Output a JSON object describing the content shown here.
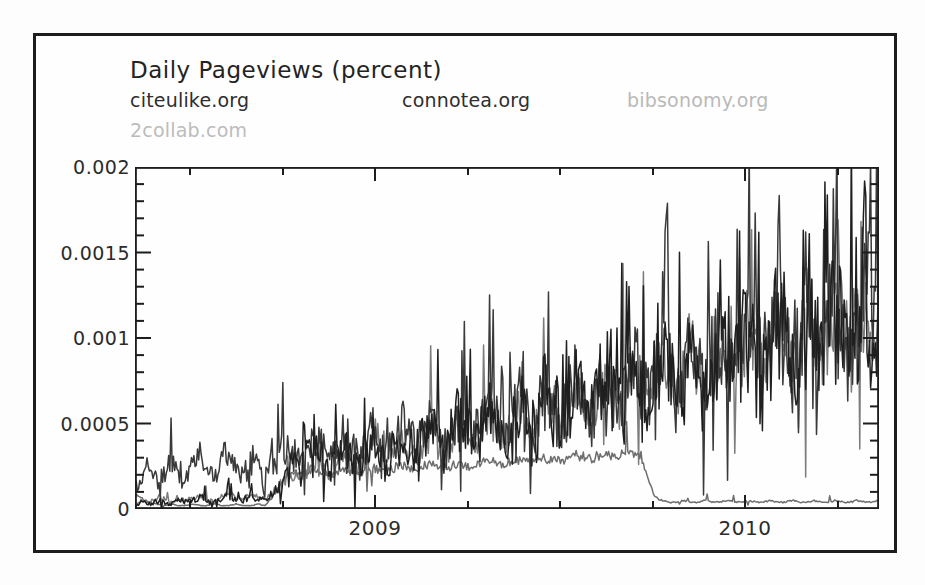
{
  "chart_data": {
    "type": "line",
    "title": "Daily Pageviews (percent)",
    "xlabel": "",
    "ylabel": "",
    "ylim": [
      0,
      0.002
    ],
    "yticks": [
      0,
      0.0005,
      0.001,
      0.0015,
      0.002
    ],
    "ytick_labels": [
      "0",
      "0.0005",
      "0.001",
      "0.0015",
      "0.002"
    ],
    "y_minor_ticks_per_interval": 4,
    "xlim": [
      "2008-09",
      "2010-06"
    ],
    "xticks": [
      "2009",
      "2010"
    ],
    "xtick_labels": [
      "2009",
      "2010"
    ],
    "x_minor_ticks_per_interval": 3,
    "grid": false,
    "legend_position": "top-left-inside",
    "series": [
      {
        "name": "citeulike.org",
        "color": "#3a3a3a",
        "values": [
          0.00012,
          0.00018,
          0.00024,
          0.00016,
          0.00021,
          0.00029,
          0.00022,
          0.00017,
          0.00026,
          0.00031,
          0.00024,
          0.00019,
          0.00028,
          0.00034,
          0.00026,
          0.00021,
          0.0003,
          0.00025,
          0.00019,
          0.00027,
          0.00033,
          0.00041,
          0.00032,
          0.00026,
          0.00035,
          0.00043,
          0.00036,
          0.00029,
          0.00038,
          0.00045,
          0.00037,
          0.0003,
          0.0004,
          0.00048,
          0.00039,
          0.00033,
          0.00042,
          0.0005,
          0.00041,
          0.00035,
          0.00044,
          0.00053,
          0.00044,
          0.00037,
          0.00047,
          0.00057,
          0.00048,
          0.0004,
          0.0005,
          0.0006,
          0.00051,
          0.00043,
          0.00054,
          0.00065,
          0.00055,
          0.00047,
          0.00058,
          0.0007,
          0.00059,
          0.0005,
          0.00062,
          0.00075,
          0.00064,
          0.00054,
          0.00067,
          0.00081,
          0.00069,
          0.00058,
          0.00072,
          0.00087,
          0.00074,
          0.00062,
          0.00078,
          0.00094,
          0.0008,
          0.00067,
          0.00083,
          0.001,
          0.00085,
          0.00071,
          0.00088,
          0.00106,
          0.0009,
          0.00076,
          0.00093,
          0.00112,
          0.00095,
          0.0008,
          0.00098,
          0.00118,
          0.001,
          0.00084,
          0.00103,
          0.00124,
          0.00105,
          0.00088,
          0.00108,
          0.0013,
          0.0011,
          0.00093,
          0.00113,
          0.00136,
          0.00115,
          0.00097
        ]
      },
      {
        "name": "connotea.org",
        "color": "#1f1f1f",
        "values": [
          2e-05,
          4e-05,
          3e-05,
          5e-05,
          4e-05,
          3e-05,
          6e-05,
          4e-05,
          5e-05,
          7e-05,
          5e-05,
          4e-05,
          6e-05,
          8e-05,
          6e-05,
          5e-05,
          8e-05,
          6e-05,
          5e-05,
          9e-05,
          0.00012,
          0.00018,
          0.00025,
          0.0002,
          0.00028,
          0.00034,
          0.00027,
          0.00022,
          0.00031,
          0.00038,
          0.0003,
          0.00025,
          0.00034,
          0.00042,
          0.00035,
          0.00029,
          0.00038,
          0.00046,
          0.00038,
          0.00032,
          0.00041,
          0.0005,
          0.00042,
          0.00035,
          0.00045,
          0.00054,
          0.00046,
          0.00039,
          0.00049,
          0.00059,
          0.0005,
          0.00042,
          0.00053,
          0.00064,
          0.00054,
          0.00046,
          0.00057,
          0.00069,
          0.00059,
          0.0005,
          0.00062,
          0.00075,
          0.00063,
          0.00053,
          0.00066,
          0.0008,
          0.00068,
          0.00057,
          0.00071,
          0.00086,
          0.00073,
          0.00061,
          0.00077,
          0.00092,
          0.00078,
          0.00066,
          0.00082,
          0.00098,
          0.00084,
          0.0007,
          0.00087,
          0.00104,
          0.00089,
          0.00075,
          0.00092,
          0.0011,
          0.00094,
          0.00079,
          0.00097,
          0.00116,
          0.00098,
          0.00083,
          0.00101,
          0.00121,
          0.00103,
          0.00087,
          0.00106,
          0.00127,
          0.00108,
          0.00091,
          0.00111,
          0.00133,
          0.00113,
          0.00095
        ]
      },
      {
        "name": "bibsonomy.org",
        "color": "#7c7c7c",
        "values": [
          3e-05,
          5e-05,
          4e-05,
          6e-05,
          5e-05,
          4e-05,
          7e-05,
          5e-05,
          6e-05,
          8e-05,
          6e-05,
          5e-05,
          7e-05,
          9e-05,
          7e-05,
          6e-05,
          9e-05,
          7e-05,
          6e-05,
          0.0001,
          0.00013,
          0.00017,
          0.00021,
          0.00018,
          0.00024,
          0.00029,
          0.00023,
          0.00019,
          0.00027,
          0.00033,
          0.00027,
          0.00022,
          0.00031,
          0.00038,
          0.00032,
          0.00026,
          0.00035,
          0.00043,
          0.00036,
          0.0003,
          0.00039,
          0.00047,
          0.0004,
          0.00034,
          0.00043,
          0.00052,
          0.00044,
          0.00037,
          0.00047,
          0.00057,
          0.00048,
          0.00041,
          0.00051,
          0.00062,
          0.00053,
          0.00045,
          0.00056,
          0.00067,
          0.00057,
          0.00048,
          0.0006,
          0.00073,
          0.00062,
          0.00052,
          0.00065,
          0.00078,
          0.00067,
          0.00056,
          0.0007,
          0.00084,
          0.00071,
          0.0006,
          0.00075,
          0.0009,
          0.00077,
          0.00065,
          0.00081,
          0.00097,
          0.00083,
          0.00069,
          0.00086,
          0.00103,
          0.00088,
          0.00074,
          0.00091,
          0.00109,
          0.00093,
          0.00078,
          0.00096,
          0.00115,
          0.00097,
          0.00082,
          0.001,
          0.0012,
          0.00102,
          0.00086,
          0.00105,
          0.00126,
          0.00107,
          0.0009,
          0.0011,
          0.00132,
          0.00112,
          0.00094
        ]
      },
      {
        "name": "2collab.com",
        "color": "#6e6e6e",
        "values": [
          9e-05,
          6e-05,
          4e-05,
          3e-05,
          2e-05,
          3e-05,
          2e-05,
          2e-05,
          3e-05,
          2e-05,
          2e-05,
          3e-05,
          2e-05,
          2e-05,
          3e-05,
          2e-05,
          2e-05,
          3e-05,
          2e-05,
          7e-05,
          0.00014,
          0.00019,
          0.00021,
          0.0002,
          0.00021,
          0.00022,
          0.00021,
          0.0002,
          0.00022,
          0.00023,
          0.00022,
          0.00021,
          0.00023,
          0.00024,
          0.00023,
          0.00022,
          0.00024,
          0.00025,
          0.00024,
          0.00023,
          0.00025,
          0.00026,
          0.00025,
          0.00024,
          0.00026,
          0.00027,
          0.00026,
          0.00025,
          0.00027,
          0.00028,
          0.00027,
          0.00026,
          0.00028,
          0.00029,
          0.00028,
          0.00027,
          0.00029,
          0.0003,
          0.00029,
          0.00028,
          0.0003,
          0.00031,
          0.0003,
          0.00029,
          0.00031,
          0.00032,
          0.00031,
          0.0003,
          0.00032,
          0.00033,
          0.00032,
          0.00018,
          7e-05,
          5e-05,
          4e-05,
          4e-05,
          5e-05,
          4e-05,
          4e-05,
          5e-05,
          4e-05,
          4e-05,
          5e-05,
          4e-05,
          4e-05,
          5e-05,
          4e-05,
          4e-05,
          5e-05,
          4e-05,
          4e-05,
          5e-05,
          4e-05,
          4e-05,
          5e-05,
          4e-05,
          4e-05,
          5e-05,
          4e-05,
          4e-05,
          5e-05,
          4e-05,
          4e-05,
          5e-05
        ]
      }
    ]
  },
  "chart": {
    "title": "Daily Pageviews (percent)",
    "legend": [
      {
        "label": "citeulike.org",
        "color": "#2e2e2e",
        "x": 0,
        "row": 0
      },
      {
        "label": "connotea.org",
        "color": "#2e2e2e",
        "x": 272,
        "row": 0
      },
      {
        "label": "bibsonomy.org",
        "color": "#b9b9b9",
        "x": 497,
        "row": 0
      },
      {
        "label": "2collab.com",
        "color": "#bcbcbc",
        "x": 0,
        "row": 1
      }
    ],
    "ytick_labels": [
      "0.002",
      "0.0015",
      "0.001",
      "0.0005",
      "0"
    ],
    "xtick_labels": [
      "2009",
      "2010"
    ]
  }
}
